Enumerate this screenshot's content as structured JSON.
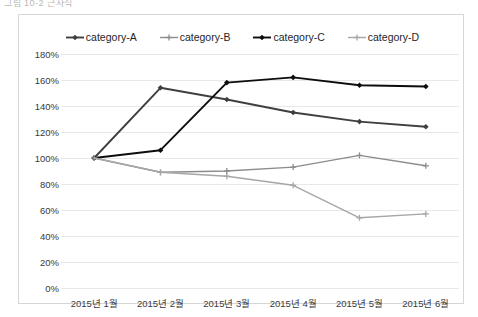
{
  "toolbar": {
    "ghost_text": "그림 10-2 근사식"
  },
  "chart_data": {
    "type": "line",
    "title": "",
    "xlabel": "",
    "ylabel": "",
    "categories": [
      "2015년 1월",
      "2015년 2월",
      "2015년 3월",
      "2015년 4월",
      "2015년 5월",
      "2015년 6월"
    ],
    "series": [
      {
        "name": "category-A",
        "values": [
          100,
          154,
          145,
          135,
          128,
          124
        ],
        "color": "#3f3f3f",
        "marker": "diamond"
      },
      {
        "name": "category-B",
        "values": [
          100,
          89,
          90,
          93,
          102,
          94
        ],
        "color": "#8c8c8c",
        "marker": "plus"
      },
      {
        "name": "category-C",
        "values": [
          100,
          106,
          158,
          162,
          156,
          155
        ],
        "color": "#0d0d0d",
        "marker": "diamond"
      },
      {
        "name": "category-D",
        "values": [
          100,
          89,
          86,
          79,
          54,
          57
        ],
        "color": "#a6a6a6",
        "marker": "plus"
      }
    ],
    "ylim": [
      0,
      180
    ],
    "ytick_step": 20,
    "ytick_labels": [
      "180%",
      "160%",
      "140%",
      "120%",
      "100%",
      "80%",
      "60%",
      "40%",
      "20%",
      "0%"
    ],
    "ytick_values": [
      180,
      160,
      140,
      120,
      100,
      80,
      60,
      40,
      20,
      0
    ],
    "grid": true,
    "grid_color": "#e8e8e8",
    "legend_position": "top",
    "plot_background": "#ffffff",
    "border_color": "#d6d6d6"
  }
}
